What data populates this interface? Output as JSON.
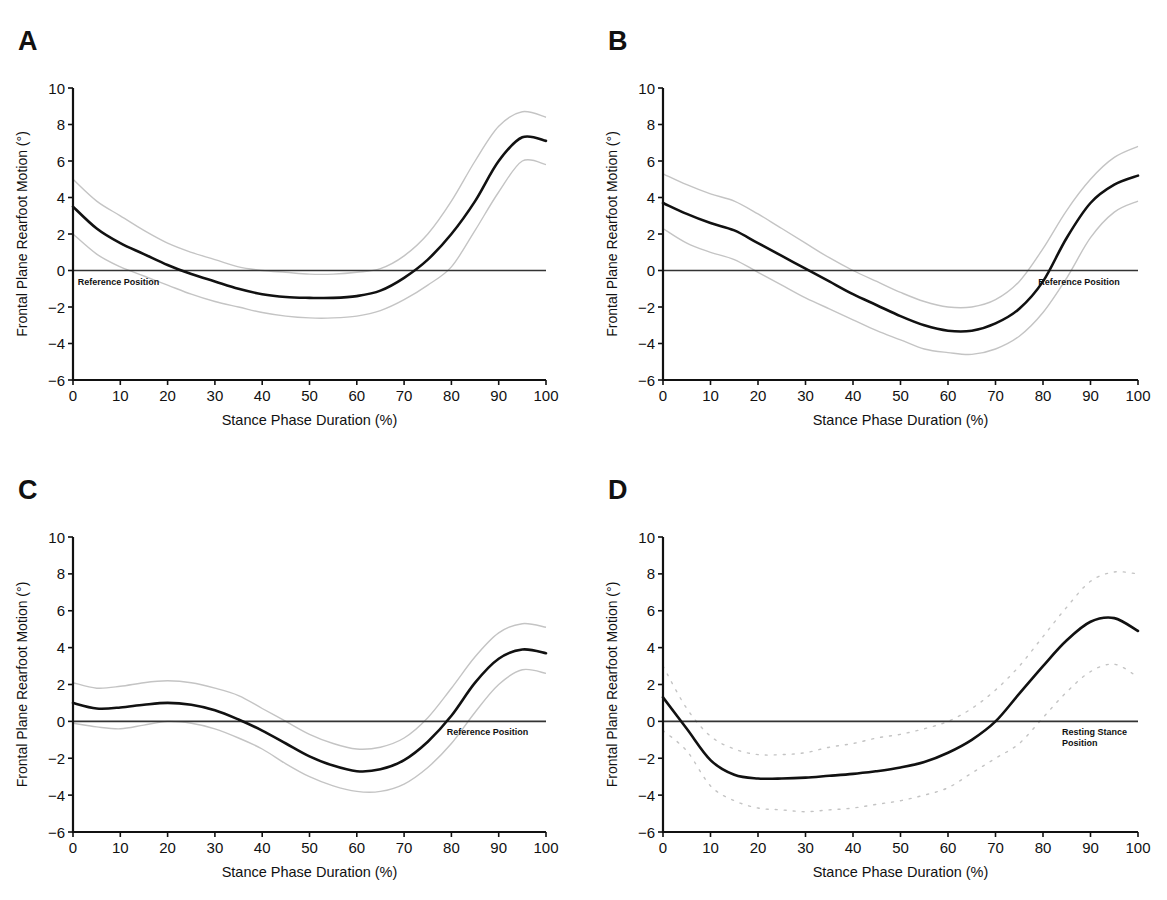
{
  "figure": {
    "panels": [
      "A",
      "B",
      "C",
      "D"
    ]
  },
  "chart_data": [
    {
      "panel": "A",
      "type": "line",
      "title": "",
      "xlabel": "Stance Phase Duration (%)",
      "ylabel": "Frontal Plane Rearfoot Motion (°)",
      "xlim": [
        0,
        100
      ],
      "ylim": [
        -6,
        10
      ],
      "xticks": [
        0,
        10,
        20,
        30,
        40,
        50,
        60,
        70,
        80,
        90,
        100
      ],
      "yticks": [
        -6,
        -4,
        -2,
        0,
        2,
        4,
        6,
        8,
        10
      ],
      "grid": false,
      "reference_line": {
        "y": 0,
        "label": "Reference Position",
        "label_x": 1,
        "label_pos": "below"
      },
      "x": [
        0,
        5,
        10,
        15,
        20,
        25,
        30,
        35,
        40,
        45,
        50,
        55,
        60,
        65,
        70,
        75,
        80,
        85,
        90,
        95,
        100
      ],
      "series": [
        {
          "name": "mean",
          "style": "solid",
          "values": [
            3.5,
            2.3,
            1.5,
            0.9,
            0.3,
            -0.2,
            -0.6,
            -1.0,
            -1.3,
            -1.45,
            -1.5,
            -1.5,
            -1.4,
            -1.1,
            -0.4,
            0.6,
            2.0,
            3.8,
            6.0,
            7.3,
            7.1
          ]
        },
        {
          "name": "upper_sd",
          "style": "faint",
          "values": [
            5.0,
            3.8,
            3.0,
            2.2,
            1.5,
            1.0,
            0.6,
            0.2,
            0.0,
            -0.1,
            -0.2,
            -0.2,
            -0.1,
            0.1,
            0.8,
            2.0,
            3.8,
            6.0,
            7.9,
            8.7,
            8.4
          ]
        },
        {
          "name": "lower_sd",
          "style": "faint",
          "values": [
            2.0,
            0.9,
            0.2,
            -0.3,
            -0.8,
            -1.3,
            -1.7,
            -2.0,
            -2.3,
            -2.5,
            -2.6,
            -2.6,
            -2.5,
            -2.2,
            -1.6,
            -0.8,
            0.2,
            2.2,
            4.3,
            6.0,
            5.8
          ]
        }
      ]
    },
    {
      "panel": "B",
      "type": "line",
      "title": "",
      "xlabel": "Stance Phase Duration (%)",
      "ylabel": "Frontal Plane Rearfoot Motion (°)",
      "xlim": [
        0,
        100
      ],
      "ylim": [
        -6,
        10
      ],
      "xticks": [
        0,
        10,
        20,
        30,
        40,
        50,
        60,
        70,
        80,
        90,
        100
      ],
      "yticks": [
        -6,
        -4,
        -2,
        0,
        2,
        4,
        6,
        8,
        10
      ],
      "grid": false,
      "reference_line": {
        "y": 0,
        "label": "Reference Position",
        "label_x": 79,
        "label_pos": "below"
      },
      "x": [
        0,
        5,
        10,
        15,
        20,
        25,
        30,
        35,
        40,
        45,
        50,
        55,
        60,
        65,
        70,
        75,
        80,
        85,
        90,
        95,
        100
      ],
      "series": [
        {
          "name": "mean",
          "style": "solid",
          "values": [
            3.7,
            3.1,
            2.6,
            2.2,
            1.5,
            0.8,
            0.1,
            -0.6,
            -1.3,
            -1.9,
            -2.5,
            -3.0,
            -3.3,
            -3.3,
            -2.9,
            -2.1,
            -0.6,
            1.8,
            3.7,
            4.7,
            5.2
          ]
        },
        {
          "name": "upper_sd",
          "style": "faint",
          "values": [
            5.3,
            4.7,
            4.2,
            3.8,
            3.1,
            2.3,
            1.5,
            0.7,
            0.0,
            -0.6,
            -1.2,
            -1.7,
            -2.0,
            -2.0,
            -1.6,
            -0.6,
            1.2,
            3.3,
            5.0,
            6.2,
            6.8
          ]
        },
        {
          "name": "lower_sd",
          "style": "faint",
          "values": [
            2.3,
            1.5,
            1.0,
            0.6,
            -0.1,
            -0.8,
            -1.5,
            -2.1,
            -2.7,
            -3.3,
            -3.8,
            -4.3,
            -4.5,
            -4.6,
            -4.3,
            -3.6,
            -2.3,
            -0.4,
            1.8,
            3.2,
            3.8
          ]
        }
      ]
    },
    {
      "panel": "C",
      "type": "line",
      "title": "",
      "xlabel": "Stance Phase Duration (%)",
      "ylabel": "Frontal Plane Rearfoot Motion (°)",
      "xlim": [
        0,
        100
      ],
      "ylim": [
        -6,
        10
      ],
      "xticks": [
        0,
        10,
        20,
        30,
        40,
        50,
        60,
        70,
        80,
        90,
        100
      ],
      "yticks": [
        -6,
        -4,
        -2,
        0,
        2,
        4,
        6,
        8,
        10
      ],
      "grid": false,
      "reference_line": {
        "y": 0,
        "label": "Reference Position",
        "label_x": 79,
        "label_pos": "below"
      },
      "x": [
        0,
        5,
        10,
        15,
        20,
        25,
        30,
        35,
        40,
        45,
        50,
        55,
        60,
        65,
        70,
        75,
        80,
        85,
        90,
        95,
        100
      ],
      "series": [
        {
          "name": "mean",
          "style": "solid",
          "values": [
            1.0,
            0.7,
            0.75,
            0.9,
            1.0,
            0.9,
            0.6,
            0.1,
            -0.5,
            -1.2,
            -1.9,
            -2.4,
            -2.7,
            -2.6,
            -2.1,
            -1.1,
            0.3,
            2.1,
            3.4,
            3.9,
            3.7
          ]
        },
        {
          "name": "upper_sd",
          "style": "faint",
          "values": [
            2.1,
            1.8,
            1.9,
            2.1,
            2.2,
            2.1,
            1.8,
            1.4,
            0.7,
            0.0,
            -0.7,
            -1.2,
            -1.5,
            -1.4,
            -0.9,
            0.2,
            1.8,
            3.5,
            4.8,
            5.3,
            5.1
          ]
        },
        {
          "name": "lower_sd",
          "style": "faint",
          "values": [
            -0.1,
            -0.3,
            -0.4,
            -0.2,
            0.0,
            -0.1,
            -0.4,
            -0.9,
            -1.5,
            -2.3,
            -3.0,
            -3.5,
            -3.8,
            -3.8,
            -3.4,
            -2.5,
            -1.2,
            0.5,
            2.0,
            2.8,
            2.6
          ]
        }
      ]
    },
    {
      "panel": "D",
      "type": "line",
      "title": "",
      "xlabel": "Stance Phase Duration (%)",
      "ylabel": "Frontal Plane Rearfoot Motion (°)",
      "xlim": [
        0,
        100
      ],
      "ylim": [
        -6,
        10
      ],
      "xticks": [
        0,
        10,
        20,
        30,
        40,
        50,
        60,
        70,
        80,
        90,
        100
      ],
      "yticks": [
        -6,
        -4,
        -2,
        0,
        2,
        4,
        6,
        8,
        10
      ],
      "grid": false,
      "reference_line": {
        "y": 0,
        "label": "Resting Stance Position",
        "label_x": 84,
        "label_pos": "below"
      },
      "x": [
        0,
        5,
        10,
        15,
        20,
        25,
        30,
        35,
        40,
        45,
        50,
        55,
        60,
        65,
        70,
        75,
        80,
        85,
        90,
        95,
        100
      ],
      "series": [
        {
          "name": "mean",
          "style": "solid",
          "values": [
            1.3,
            -0.4,
            -2.1,
            -2.9,
            -3.1,
            -3.1,
            -3.05,
            -2.95,
            -2.85,
            -2.7,
            -2.5,
            -2.2,
            -1.7,
            -1.0,
            0.0,
            1.5,
            3.0,
            4.4,
            5.4,
            5.6,
            4.9
          ]
        },
        {
          "name": "upper_sd",
          "style": "dotted-faint",
          "values": [
            3.0,
            0.7,
            -0.8,
            -1.5,
            -1.8,
            -1.8,
            -1.7,
            -1.4,
            -1.2,
            -0.9,
            -0.7,
            -0.4,
            0.0,
            0.7,
            1.7,
            3.0,
            4.6,
            6.2,
            7.6,
            8.1,
            8.0
          ]
        },
        {
          "name": "lower_sd",
          "style": "dotted-faint",
          "values": [
            -0.5,
            -1.6,
            -3.5,
            -4.3,
            -4.7,
            -4.8,
            -4.9,
            -4.8,
            -4.7,
            -4.5,
            -4.3,
            -4.0,
            -3.6,
            -2.8,
            -2.0,
            -1.2,
            0.2,
            1.6,
            2.7,
            3.1,
            2.4
          ]
        }
      ]
    }
  ],
  "layout": {
    "panels": [
      {
        "left": 0,
        "top": 0,
        "axis_x0": 73,
        "axis_x100": 546,
        "axis_y10": 88,
        "axis_yneg6": 380
      },
      {
        "left": 583,
        "top": 0,
        "axis_x0": 80,
        "axis_x100": 555,
        "axis_y10": 88,
        "axis_yneg6": 380
      },
      {
        "left": 0,
        "top": 450,
        "axis_x0": 73,
        "axis_x100": 546,
        "axis_y10": 87,
        "axis_yneg6": 382
      },
      {
        "left": 583,
        "top": 450,
        "axis_x0": 80,
        "axis_x100": 555,
        "axis_y10": 87,
        "axis_yneg6": 382
      }
    ]
  },
  "colors": {
    "mean": "#111111",
    "sd": "#c4c4c4",
    "axis": "#111111",
    "reference": "#333333"
  }
}
